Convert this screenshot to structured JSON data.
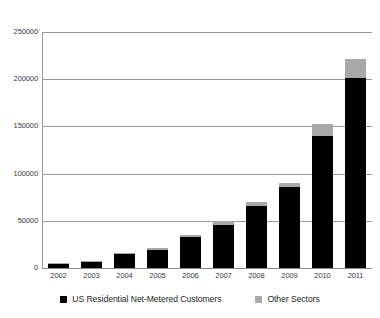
{
  "chart_data": {
    "type": "bar",
    "stacked": true,
    "title": "",
    "xlabel": "",
    "ylabel": "",
    "categories": [
      "2002",
      "2003",
      "2004",
      "2005",
      "2006",
      "2007",
      "2008",
      "2009",
      "2010",
      "2011"
    ],
    "series": [
      {
        "name": "US Residential Net-Metered Customers",
        "color": "#000000",
        "values": [
          4500,
          7000,
          15000,
          19500,
          32500,
          46000,
          66000,
          86000,
          140000,
          201000
        ]
      },
      {
        "name": "Other Sectors",
        "color": "#a8a8a8",
        "values": [
          500,
          800,
          1200,
          1800,
          2000,
          4000,
          4000,
          4000,
          13000,
          20000
        ]
      }
    ],
    "ylim": [
      0,
      250000
    ],
    "yticks": [
      0,
      50000,
      100000,
      150000,
      200000,
      250000
    ],
    "ytick_labels": [
      "0",
      "50000",
      "100000",
      "150000",
      "200000",
      "250000"
    ],
    "grid": true,
    "legend_position": "bottom"
  },
  "legend": {
    "entries": [
      {
        "label": "US Residential Net-Metered Customers",
        "color": "#000000"
      },
      {
        "label": "Other Sectors",
        "color": "#a8a8a8"
      }
    ]
  },
  "axis": {
    "gridline_color": "#9a9a9a",
    "tick_text_color": "#3b3b3b"
  }
}
